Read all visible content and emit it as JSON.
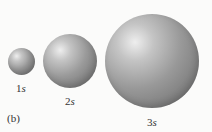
{
  "figure": {
    "panel_label": "(b)",
    "orbitals": [
      {
        "number": "1",
        "letter": "s",
        "label": "1s",
        "cx": 21,
        "cy": 61,
        "r": 13.5,
        "label_x": 21,
        "label_y": 83
      },
      {
        "number": "2",
        "letter": "s",
        "label": "2s",
        "cx": 70,
        "cy": 61,
        "r": 27,
        "label_x": 70,
        "label_y": 96
      },
      {
        "number": "3",
        "letter": "s",
        "label": "3s",
        "cx": 152,
        "cy": 61,
        "r": 47,
        "label_x": 152,
        "label_y": 117
      }
    ]
  }
}
